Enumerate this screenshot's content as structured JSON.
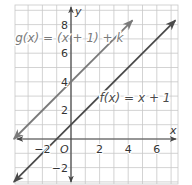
{
  "chart_data": {
    "type": "line",
    "title": "",
    "xlabel": "x",
    "ylabel": "y",
    "origin_label": "O",
    "xlim": [
      -4,
      7.6
    ],
    "ylim": [
      -3.2,
      9.5
    ],
    "grid": true,
    "grid_step": 1,
    "x_ticks": [
      {
        "value": -2,
        "label": "−2"
      },
      {
        "value": 2,
        "label": "2"
      },
      {
        "value": 4,
        "label": "4"
      },
      {
        "value": 6,
        "label": "6"
      }
    ],
    "y_ticks": [
      {
        "value": 8,
        "label": "8"
      },
      {
        "value": 6,
        "label": "6"
      },
      {
        "value": 4,
        "label": "4"
      },
      {
        "value": 2,
        "label": "2"
      },
      {
        "value": -2,
        "label": "−2"
      }
    ],
    "series": [
      {
        "name": "g(x) = (x + 1) + k",
        "slope": 1,
        "intercept": 4,
        "x_range": [
          -4,
          4.3
        ],
        "color": "#7a7a7a",
        "label_pos": {
          "x": -3.9,
          "y": 6.8
        }
      },
      {
        "name": "f(x) = x + 1",
        "slope": 1,
        "intercept": 1,
        "x_range": [
          -4,
          7.3
        ],
        "color": "#4a4a4a",
        "label_pos": {
          "x": 2.0,
          "y": 2.6
        }
      }
    ],
    "colors": {
      "grid": "#c8c8c8",
      "axis": "#444444"
    }
  }
}
